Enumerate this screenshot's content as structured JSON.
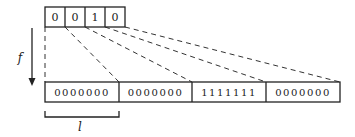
{
  "diagram": {
    "top_bits": [
      "0",
      "0",
      "1",
      "0"
    ],
    "bottom_blocks": [
      "0000000",
      "0000000",
      "1111111",
      "0000000"
    ],
    "arrow_label": "f",
    "bracket_label": "l",
    "colors": {
      "stroke": "#222222",
      "background": "#ffffff"
    }
  }
}
